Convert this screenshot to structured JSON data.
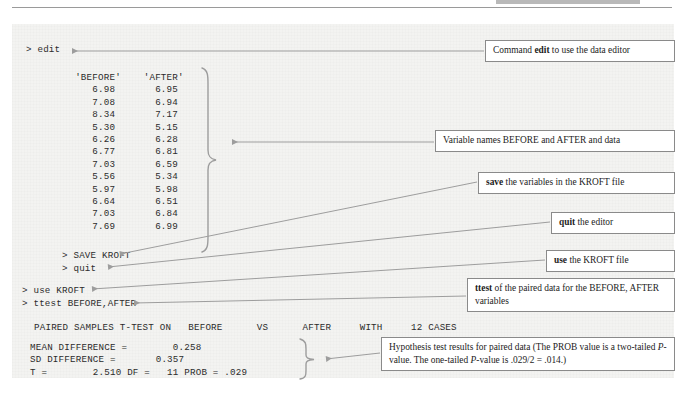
{
  "figure": {
    "title_hidden_header": "",
    "panel_bg": "#f3f3f1",
    "ink": "#2b2b2b",
    "rule_color": "#9a9a9a"
  },
  "console": {
    "cmd_edit": "> edit",
    "cmd_save": "> SAVE KROFT",
    "cmd_quit": "> quit",
    "cmd_use": "> use KROFT",
    "cmd_ttest": "> ttest BEFORE,AFTER",
    "result_header": "PAIRED SAMPLES T-TEST ON   BEFORE      VS      AFTER     WITH     12 CASES",
    "data_block": "   'BEFORE'    'AFTER'\n      6.98       6.95\n      7.08       6.94\n      8.34       7.17\n      5.30       5.15\n      6.26       6.28\n      6.77       6.81\n      7.03       6.59\n      5.56       5.34\n      5.97       5.98\n      6.64       6.51\n      7.03       6.84\n      7.69       6.99",
    "result_block": "MEAN DIFFERENCE =        0.258\nSD DIFFERENCE =       0.357\nT =        2.510 DF =   11 PROB = .029"
  },
  "data_table": {
    "columns": [
      "'BEFORE'",
      "'AFTER'"
    ],
    "before": [
      6.98,
      7.08,
      8.34,
      5.3,
      6.26,
      6.77,
      7.03,
      5.56,
      5.97,
      6.64,
      7.03,
      7.69
    ],
    "after": [
      6.95,
      6.94,
      7.17,
      5.15,
      6.28,
      6.81,
      6.59,
      5.34,
      5.98,
      6.51,
      6.84,
      6.99
    ]
  },
  "results": {
    "test_name": "PAIRED SAMPLES T-TEST ON",
    "var1": "BEFORE",
    "vs": "VS",
    "var2": "AFTER",
    "with": "WITH",
    "cases": "12 CASES",
    "mean_difference_label": "MEAN DIFFERENCE =",
    "mean_difference_value": "0.258",
    "sd_difference_label": "SD DIFFERENCE =",
    "sd_difference_value": "0.357",
    "t_label": "T =",
    "t_value": "2.510",
    "df_label": "DF =",
    "df_value": "11",
    "prob_label": "PROB =",
    "prob_value": ".029"
  },
  "callouts": [
    {
      "id": "edit",
      "pre": "Command ",
      "bold": "edit",
      "post": " to use the data editor"
    },
    {
      "id": "vars",
      "pre": "",
      "bold": "",
      "post": "Variable names BEFORE and AFTER and data",
      "plain": "Variable names BEFORE and AFTER and data"
    },
    {
      "id": "save",
      "pre": "",
      "bold": "save",
      "post": " the variables in the KROFT file"
    },
    {
      "id": "quit",
      "pre": "",
      "bold": "quit",
      "post": " the editor"
    },
    {
      "id": "use",
      "pre": "",
      "bold": "use",
      "post": " the KROFT file"
    },
    {
      "id": "ttest",
      "pre": "",
      "bold": "ttest",
      "post": " of the paired data for the BEFORE, AFTER variables"
    },
    {
      "id": "hypothesis",
      "line1_a": "Hypothesis test results for paired data (The PROB value is a",
      "line2_a": "two-tailed ",
      "line2_i": "P",
      "line2_b": "-value. The one-tailed ",
      "line2_i2": "P",
      "line2_c": "-value is .029/2 = .014.)"
    }
  ]
}
